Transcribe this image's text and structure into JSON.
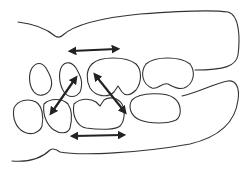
{
  "diagram": {
    "type": "dental-occlusion-line-art",
    "stroke_color": "#333333",
    "arrow_color": "#222222",
    "background": "#ffffff",
    "arrows": [
      {
        "id": "upper-horizontal",
        "direction": "bidirectional-horizontal"
      },
      {
        "id": "diagonal-left",
        "direction": "bidirectional-diagonal"
      },
      {
        "id": "diagonal-right",
        "direction": "bidirectional-diagonal"
      },
      {
        "id": "lower-horizontal",
        "direction": "bidirectional-horizontal"
      }
    ]
  }
}
